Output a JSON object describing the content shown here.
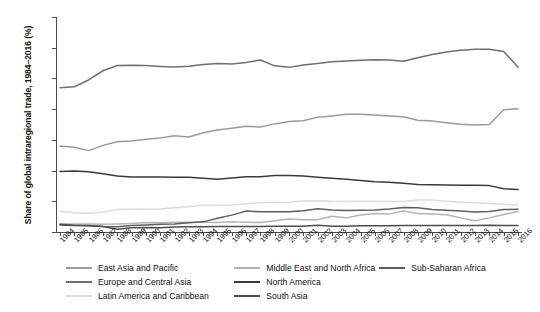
{
  "chart_data": {
    "type": "line",
    "title": "",
    "xlabel": "",
    "ylabel": "Share of global intraregional trade, 1984–2016 (%)",
    "ylim": [
      0,
      70
    ],
    "yticks": [
      0,
      10,
      20,
      30,
      40,
      50,
      60,
      70
    ],
    "grid": false,
    "legend_position": "bottom",
    "x": [
      1984,
      1985,
      1986,
      1987,
      1988,
      1989,
      1990,
      1991,
      1992,
      1993,
      1994,
      1995,
      1996,
      1997,
      1998,
      1999,
      2000,
      2001,
      2002,
      2003,
      2004,
      2005,
      2006,
      2007,
      2008,
      2009,
      2010,
      2011,
      2012,
      2013,
      2014,
      2015,
      2016
    ],
    "series": [
      {
        "name": "East Asia and Pacific",
        "color": "#9a9a9a",
        "values": [
          28.0,
          27.6,
          26.5,
          28.2,
          29.4,
          29.6,
          30.2,
          30.6,
          31.3,
          30.9,
          32.3,
          33.2,
          33.8,
          34.4,
          34.2,
          35.2,
          36.0,
          36.2,
          37.4,
          37.8,
          38.3,
          38.3,
          38.1,
          37.8,
          37.5,
          36.4,
          36.1,
          35.6,
          35.1,
          34.8,
          35.0,
          39.8,
          40.1
        ]
      },
      {
        "name": "Europe and Central Asia",
        "color": "#6f6f6f",
        "values": [
          47.0,
          47.3,
          49.5,
          52.5,
          54.2,
          54.3,
          54.2,
          53.9,
          53.7,
          54.0,
          54.5,
          54.9,
          54.7,
          55.2,
          56.0,
          54.1,
          53.6,
          54.4,
          54.9,
          55.4,
          55.7,
          55.9,
          56.1,
          56.0,
          55.6,
          56.7,
          57.8,
          58.6,
          59.2,
          59.5,
          59.5,
          58.8,
          53.6
        ]
      },
      {
        "name": "Latin America and Caribbean",
        "color": "#dcdcdc",
        "values": [
          6.7,
          6.3,
          6.1,
          6.5,
          7.3,
          7.4,
          7.4,
          7.5,
          7.9,
          8.3,
          8.7,
          8.6,
          8.8,
          9.2,
          9.6,
          9.6,
          9.7,
          10.1,
          10.2,
          10.0,
          9.9,
          10.0,
          9.9,
          9.9,
          9.9,
          10.4,
          10.4,
          10.0,
          9.7,
          9.5,
          9.3,
          9.0,
          8.8
        ]
      },
      {
        "name": "Middle East and North Africa",
        "color": "#b4b4b4",
        "values": [
          2.6,
          2.6,
          2.6,
          2.5,
          2.6,
          2.8,
          3.1,
          3.0,
          3.2,
          3.2,
          3.2,
          3.1,
          3.3,
          3.2,
          3.1,
          3.7,
          4.2,
          4.0,
          4.0,
          5.1,
          4.6,
          5.5,
          6.0,
          5.9,
          6.8,
          6.0,
          5.9,
          5.6,
          4.6,
          3.7,
          4.6,
          5.7,
          6.7
        ]
      },
      {
        "name": "North America",
        "color": "#3a3a3a",
        "values": [
          19.7,
          19.9,
          19.6,
          19.0,
          18.2,
          17.9,
          17.9,
          17.9,
          17.8,
          17.8,
          17.5,
          17.2,
          17.6,
          18.0,
          18.0,
          18.4,
          18.4,
          18.2,
          17.8,
          17.5,
          17.2,
          16.8,
          16.4,
          16.2,
          15.9,
          15.5,
          15.4,
          15.3,
          15.2,
          15.2,
          15.1,
          14.1,
          13.8
        ]
      },
      {
        "name": "South Asia",
        "color": "#4d4d4d",
        "values": [
          2.3,
          2.1,
          2.0,
          1.8,
          0.9,
          1.4,
          1.5,
          1.4,
          1.6,
          1.7,
          1.7,
          1.8,
          1.8,
          1.8,
          1.8,
          1.9,
          1.9,
          1.9,
          2.2,
          1.9,
          1.9,
          2.0,
          2.0,
          2.0,
          2.1,
          2.1,
          2.1,
          2.1,
          2.1,
          2.1,
          2.2,
          2.1,
          2.1
        ]
      },
      {
        "name": "Sub-Saharan Africa",
        "color": "#5f5f5f",
        "values": [
          2.5,
          2.2,
          2.1,
          1.8,
          1.7,
          2.1,
          2.3,
          2.5,
          2.6,
          3.0,
          3.3,
          4.5,
          5.5,
          6.8,
          6.6,
          6.6,
          6.6,
          6.9,
          7.6,
          7.2,
          7.0,
          7.1,
          7.2,
          7.5,
          8.0,
          7.9,
          7.3,
          7.1,
          6.8,
          6.5,
          6.7,
          7.3,
          7.4
        ]
      }
    ]
  },
  "legend": {
    "items": [
      {
        "label": "East Asia and Pacific"
      },
      {
        "label": "Europe and Central Asia"
      },
      {
        "label": "Latin America and Caribbean"
      },
      {
        "label": "Middle East and North Africa"
      },
      {
        "label": "North America"
      },
      {
        "label": "South Asia"
      },
      {
        "label": "Sub-Saharan Africa"
      }
    ]
  }
}
